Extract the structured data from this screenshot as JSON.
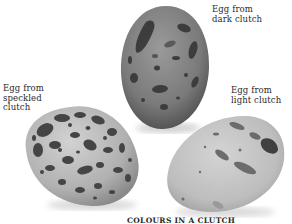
{
  "figure": {
    "title": "COLOURS IN A CLUTCH",
    "captions": {
      "dark": "Egg from\ndark clutch",
      "speckled": "Egg from\nspeckled\nclutch",
      "light": "Egg from\nlight clutch"
    }
  },
  "eggs": [
    {
      "name": "dark-clutch-egg",
      "base_color": "#7d7d7d",
      "marking_color": "#3c3c3c"
    },
    {
      "name": "speckled-clutch-egg",
      "base_color": "#b9b9b9",
      "marking_color": "#4a4a4a"
    },
    {
      "name": "light-clutch-egg",
      "base_color": "#c2c2c2",
      "marking_color": "#6e6e6e"
    }
  ]
}
